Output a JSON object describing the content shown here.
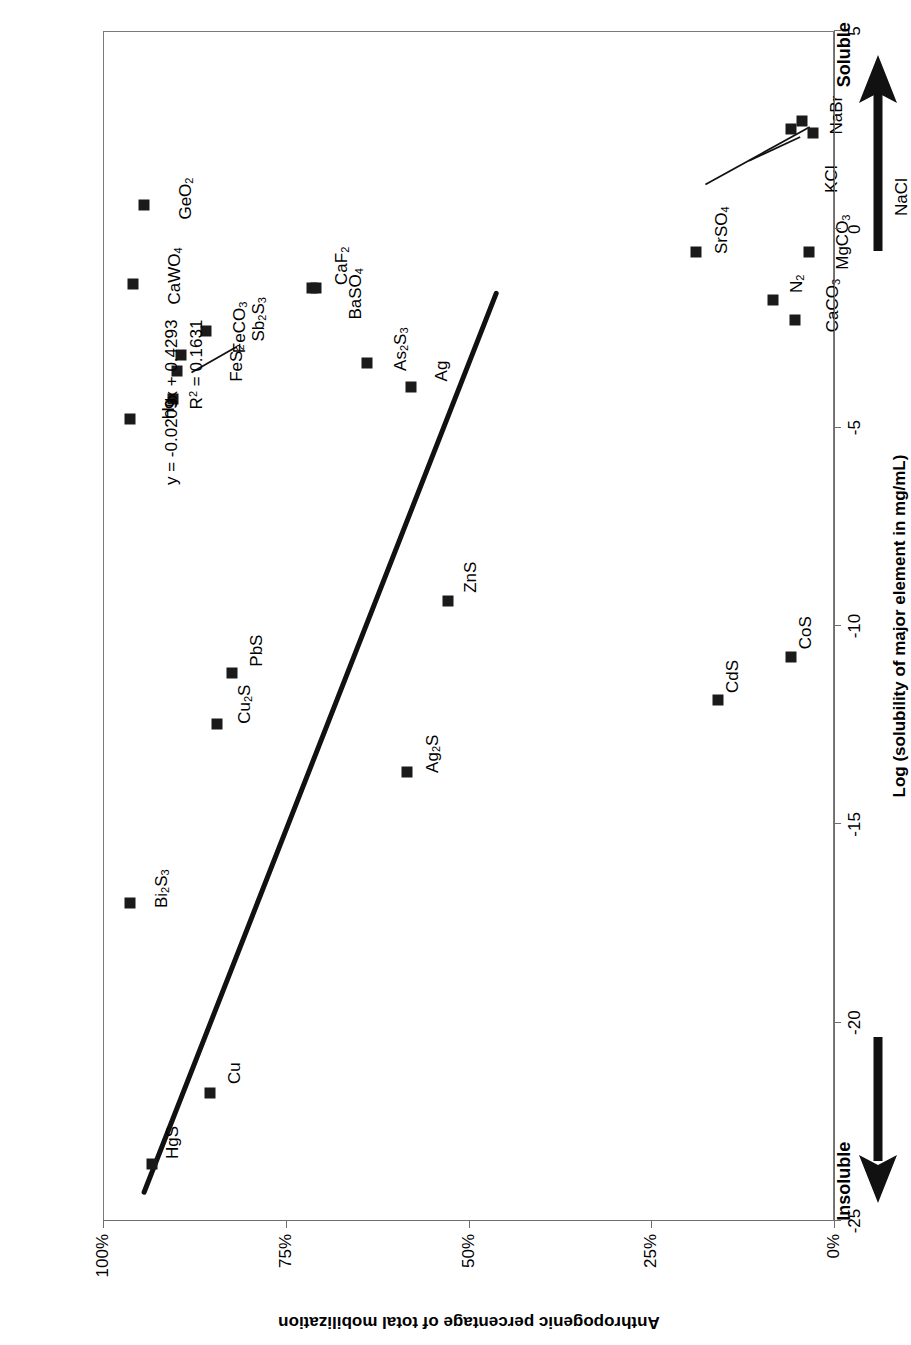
{
  "chart_data": {
    "type": "scatter",
    "title": "",
    "xlabel": "Log (solubility of major element in mg/mL)",
    "ylabel": "Anthropogenic percentage of total mobilization",
    "xlim": [
      -25,
      5
    ],
    "ylim": [
      0,
      1
    ],
    "xticks": [
      -25,
      -20,
      -15,
      -10,
      -5,
      0,
      5
    ],
    "xtick_labels": [
      "-25",
      "-20",
      "-15",
      "-10",
      "-5",
      "0",
      "5"
    ],
    "yticks": [
      0,
      0.25,
      0.5,
      0.75,
      1.0
    ],
    "ytick_labels": [
      "0%",
      "25%",
      "50%",
      "75%",
      "100%"
    ],
    "grid": false,
    "legend": null,
    "axis_endpoint_low_label": "Insoluble",
    "axis_endpoint_high_label": "Soluble",
    "trendline": {
      "equation": "y = -0.0209x + 0.4293",
      "r_squared_label": "R2 = 0.1631",
      "slope": -0.0209,
      "intercept": 0.4293,
      "r_squared": 0.1631,
      "x_start": -24.3,
      "x_end": -1.6
    },
    "points": [
      {
        "label": "HgS",
        "label_html": "HgS",
        "x": -23.6,
        "y": 0.935,
        "label_dx": 22,
        "label_dy": 20
      },
      {
        "label": "Cu",
        "label_html": "Cu",
        "x": -21.8,
        "y": 0.855,
        "label_dx": 20,
        "label_dy": 24
      },
      {
        "label": "Bi2S3",
        "label_html": "Bi<sub>2</sub>S<sub>3</sub>",
        "x": -17.0,
        "y": 0.965,
        "label_dx": 14,
        "label_dy": 32
      },
      {
        "label": "Ag2S",
        "label_html": "Ag<sub>2</sub>S",
        "x": -13.7,
        "y": 0.585,
        "label_dx": 18,
        "label_dy": 26
      },
      {
        "label": "Cu2S",
        "label_html": "Cu<sub>2</sub>S",
        "x": -12.5,
        "y": 0.845,
        "label_dx": 20,
        "label_dy": 28
      },
      {
        "label": "PbS",
        "label_html": "PbS",
        "x": -11.2,
        "y": 0.825,
        "label_dx": 22,
        "label_dy": 24
      },
      {
        "label": "CdS",
        "label_html": "CdS",
        "x": -11.9,
        "y": 0.16,
        "label_dx": 24,
        "label_dy": 14
      },
      {
        "label": "CoS",
        "label_html": "CoS",
        "x": -10.8,
        "y": 0.06,
        "label_dx": 24,
        "label_dy": 14
      },
      {
        "label": "ZnS",
        "label_html": "ZnS",
        "x": -9.4,
        "y": 0.53,
        "label_dx": 24,
        "label_dy": 22
      },
      {
        "label": "Hg",
        "label_html": "Hg",
        "x": -4.8,
        "y": 0.965,
        "label_dx": 10,
        "label_dy": 38
      },
      {
        "label": "Hg-b",
        "label_html": "",
        "x": -4.3,
        "y": 0.905,
        "label_dx": 0,
        "label_dy": 0
      },
      {
        "label": "FeS2",
        "label_html": "FeS<sub>2</sub>",
        "x": -3.6,
        "y": 0.9,
        "label_dx": 8,
        "label_dy": 60
      },
      {
        "label": "Sb2S3",
        "label_html": "Sb<sub>2</sub>S<sub>3</sub>",
        "x": -3.2,
        "y": 0.895,
        "label_dx": 36,
        "label_dy": 78
      },
      {
        "label": "FeCO3",
        "label_html": "FeCO<sub>3</sub>",
        "x": -2.6,
        "y": 0.86,
        "label_dx": 4,
        "label_dy": 34
      },
      {
        "label": "As2S3",
        "label_html": "As<sub>2</sub>S<sub>3</sub>",
        "x": -3.4,
        "y": 0.64,
        "label_dx": 14,
        "label_dy": 34
      },
      {
        "label": "Ag",
        "label_html": "Ag",
        "x": -4.0,
        "y": 0.58,
        "label_dx": 16,
        "label_dy": 30
      },
      {
        "label": "CaCO3",
        "label_html": "CaCO<sub>3</sub>",
        "x": -2.3,
        "y": 0.055,
        "label_dx": 14,
        "label_dy": 38
      },
      {
        "label": "N2",
        "label_html": "N<sub>2</sub>",
        "x": -1.8,
        "y": 0.085,
        "label_dx": 16,
        "label_dy": 24
      },
      {
        "label": "CaWO4",
        "label_html": "CaWO<sub>4</sub>",
        "x": -1.4,
        "y": 0.96,
        "label_dx": 8,
        "label_dy": 42
      },
      {
        "label": "BaSO4",
        "label_html": "BaSO<sub>4</sub>",
        "x": -1.5,
        "y": 0.715,
        "label_dx": -6,
        "label_dy": 44
      },
      {
        "label": "CaF2",
        "label_html": "CaF<sub>2</sub>",
        "x": -1.5,
        "y": 0.71,
        "label_dx": 22,
        "label_dy": 26
      },
      {
        "label": "SrSO4",
        "label_html": "SrSO<sub>4</sub>",
        "x": -0.6,
        "y": 0.19,
        "label_dx": 22,
        "label_dy": 26
      },
      {
        "label": "MgCO3",
        "label_html": "MgCO<sub>3</sub>",
        "x": -0.6,
        "y": 0.035,
        "label_dx": 10,
        "label_dy": 34
      },
      {
        "label": "GeO2",
        "label_html": "GeO<sub>2</sub>",
        "x": 0.6,
        "y": 0.945,
        "label_dx": 6,
        "label_dy": 42
      },
      {
        "label": "NaCl",
        "label_html": "NaCl",
        "x": 2.4,
        "y": 0.03,
        "label_dx": -64,
        "label_dy": 88
      },
      {
        "label": "KCl",
        "label_html": "KCl",
        "x": 2.5,
        "y": 0.06,
        "label_dx": -50,
        "label_dy": 40
      },
      {
        "label": "NaBr",
        "label_html": "NaBr",
        "x": 2.7,
        "y": 0.045,
        "label_dx": 6,
        "label_dy": 34
      }
    ],
    "leader_lines": [
      {
        "from_label": "Sb2S3",
        "x1": -3.6,
        "y1": 0.88,
        "x2": -2.95,
        "y2": 0.818
      },
      {
        "from_label": "KCl",
        "x1": 1.75,
        "y1": 0.115,
        "x2": 2.35,
        "y2": 0.045
      },
      {
        "from_label": "NaCl",
        "x1": 1.15,
        "y1": 0.175,
        "x2": 2.6,
        "y2": 0.032
      }
    ]
  }
}
